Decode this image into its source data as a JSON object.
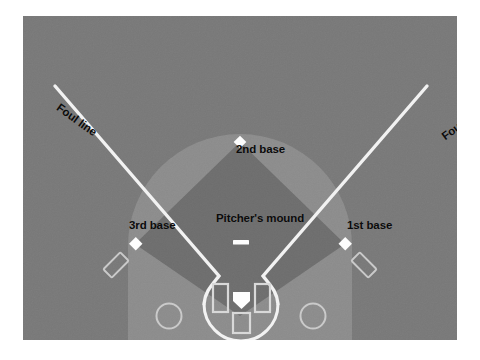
{
  "diagram": {
    "labels": {
      "foul_line_left": "Foul line",
      "foul_line_right": "Foul line",
      "second_base": "2nd base",
      "pitchers_mound": "Pitcher's mound",
      "third_base": "3rd base",
      "first_base": "1st base",
      "home_plate": "Home plate"
    },
    "colors": {
      "page_background": "#ffffff",
      "outfield_grass": "#787878",
      "outfield_arc": "#8b8b8b",
      "infield_dirt": "#6d6d6d",
      "chalk_line": "#f2f2f2",
      "base_marker": "#fdfdfd",
      "label_text": "#0b0b0b"
    },
    "elements": [
      {
        "name": "outfield-grass",
        "kind": "region",
        "fill": "#787878"
      },
      {
        "name": "outfield-arc",
        "kind": "region",
        "fill": "#8b8b8b"
      },
      {
        "name": "infield-diamond",
        "kind": "region",
        "fill": "#6d6d6d"
      },
      {
        "name": "foul-line-left",
        "kind": "line",
        "stroke": "#f2f2f2"
      },
      {
        "name": "foul-line-right",
        "kind": "line",
        "stroke": "#f2f2f2"
      },
      {
        "name": "first-base-marker",
        "kind": "base"
      },
      {
        "name": "second-base-marker",
        "kind": "base"
      },
      {
        "name": "third-base-marker",
        "kind": "base"
      },
      {
        "name": "home-plate-marker",
        "kind": "base"
      },
      {
        "name": "pitchers-rubber",
        "kind": "marker"
      },
      {
        "name": "batters-box-left",
        "kind": "outline"
      },
      {
        "name": "batters-box-right",
        "kind": "outline"
      },
      {
        "name": "catchers-box",
        "kind": "outline"
      },
      {
        "name": "coachs-box-left",
        "kind": "outline"
      },
      {
        "name": "coachs-box-right",
        "kind": "outline"
      },
      {
        "name": "on-deck-circle-left",
        "kind": "outline"
      },
      {
        "name": "on-deck-circle-right",
        "kind": "outline"
      }
    ]
  }
}
